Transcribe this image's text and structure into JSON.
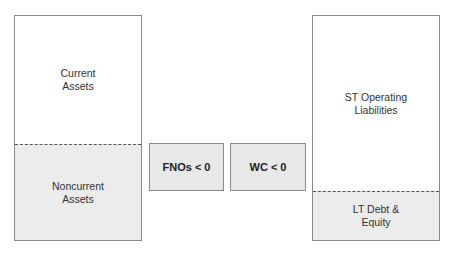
{
  "assets": {
    "top": {
      "label": "Current\nAssets"
    },
    "bottom": {
      "label": "Noncurrent\nAssets"
    }
  },
  "middle": [
    {
      "label": "FNOs < 0"
    },
    {
      "label": "WC < 0"
    }
  ],
  "liabilities": {
    "top": {
      "label": "ST Operating\nLiabilities"
    },
    "bottom": {
      "label": "LT Debt &\nEquity"
    }
  },
  "colors": {
    "shade": "#ececec",
    "border": "#8a8a8a"
  }
}
